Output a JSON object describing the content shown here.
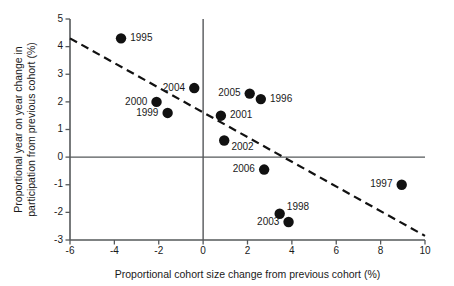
{
  "chart_data": {
    "type": "scatter",
    "title": "",
    "xlabel": "Proportional cohort size change from previous cohort (%)",
    "ylabel": "Proportional year on year change in participation from previous cohort (%)",
    "xlim": [
      -6,
      10
    ],
    "ylim": [
      -3,
      5
    ],
    "xticks": [
      -6,
      -4,
      -2,
      0,
      2,
      4,
      6,
      8,
      10
    ],
    "yticks": [
      5,
      4,
      3,
      2,
      1,
      0,
      -1,
      -2,
      -3
    ],
    "xtick_labels": [
      "-6",
      "-4",
      "-2",
      "0",
      "2",
      "4",
      "6",
      "8",
      "10"
    ],
    "ytick_labels": [
      "5",
      "4",
      "3",
      "2",
      "1",
      "0",
      "-1",
      "-2",
      "-3"
    ],
    "grid": false,
    "legend": "none",
    "zero_lines": {
      "x": 0,
      "y": 0
    },
    "marker_color": "#111111",
    "marker_shape": "circle",
    "points": [
      {
        "label": "1995",
        "x": -3.7,
        "y": 4.3,
        "label_side": "right"
      },
      {
        "label": "2000",
        "x": -2.1,
        "y": 2.0,
        "label_side": "left"
      },
      {
        "label": "1999",
        "x": -1.6,
        "y": 1.6,
        "label_side": "left"
      },
      {
        "label": "2004",
        "x": -0.4,
        "y": 2.5,
        "label_side": "left"
      },
      {
        "label": "2001",
        "x": 0.8,
        "y": 1.5,
        "label_side": "right"
      },
      {
        "label": "2002",
        "x": 0.95,
        "y": 0.6,
        "label_side": "right-below"
      },
      {
        "label": "2005",
        "x": 2.1,
        "y": 2.3,
        "label_side": "left"
      },
      {
        "label": "1996",
        "x": 2.6,
        "y": 2.1,
        "label_side": "right"
      },
      {
        "label": "2006",
        "x": 2.75,
        "y": -0.45,
        "label_side": "left"
      },
      {
        "label": "1998",
        "x": 3.45,
        "y": -2.05,
        "label_side": "right-above"
      },
      {
        "label": "2003",
        "x": 3.85,
        "y": -2.35,
        "label_side": "left"
      },
      {
        "label": "1997",
        "x": 8.95,
        "y": -1.0,
        "label_side": "left"
      }
    ],
    "trend_line": {
      "style": "dashed",
      "color": "#111111",
      "x_start": -6,
      "y_start": 4.3,
      "x_end": 10,
      "y_end": -2.85
    }
  }
}
